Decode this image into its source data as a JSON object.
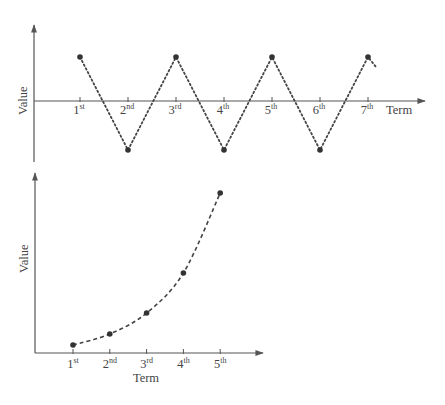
{
  "chart_data": [
    {
      "type": "line",
      "title": "",
      "xlabel": "Term",
      "ylabel": "Value",
      "categories": [
        "1st",
        "2nd",
        "3rd",
        "4th",
        "5th",
        "6th",
        "7th"
      ],
      "tick_labels": [
        {
          "num": "1",
          "sup": "st"
        },
        {
          "num": "2",
          "sup": "nd"
        },
        {
          "num": "3",
          "sup": "rd"
        },
        {
          "num": "4",
          "sup": "th"
        },
        {
          "num": "5",
          "sup": "th"
        },
        {
          "num": "6",
          "sup": "th"
        },
        {
          "num": "7",
          "sup": "th"
        }
      ],
      "values": [
        1,
        -1,
        1,
        -1,
        1,
        -1,
        1
      ],
      "line_style": "dotted",
      "continues_after_last": true,
      "grid": false,
      "axes": "x-axis through zero, arrowheads on both axes",
      "ylim": [
        -1.2,
        1.8
      ]
    },
    {
      "type": "line",
      "title": "",
      "xlabel": "Term",
      "ylabel": "Value",
      "categories": [
        "1st",
        "2nd",
        "3rd",
        "4th",
        "5th"
      ],
      "tick_labels": [
        {
          "num": "1",
          "sup": "st"
        },
        {
          "num": "2",
          "sup": "nd"
        },
        {
          "num": "3",
          "sup": "rd"
        },
        {
          "num": "4",
          "sup": "th"
        },
        {
          "num": "5",
          "sup": "th"
        }
      ],
      "values": [
        1,
        2,
        4,
        8,
        16
      ],
      "line_style": "dashed curve",
      "grid": false,
      "axes": "origin at bottom-left, arrowheads on both axes",
      "ylim": [
        0,
        18
      ]
    }
  ],
  "colors": {
    "axis": "#555555",
    "line": "#444444",
    "point": "#333333",
    "text": "#444444"
  }
}
